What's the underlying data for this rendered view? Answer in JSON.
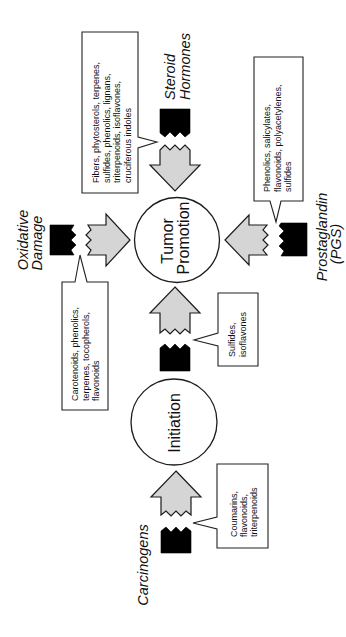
{
  "stages": {
    "tumor_promotion": [
      "Tumor",
      "Promotion"
    ],
    "initiation": "Initiation"
  },
  "factors": {
    "steroid_hormones": [
      "Steroid",
      "Hormones"
    ],
    "oxidative_damage": [
      "Oxidative",
      "Damage"
    ],
    "prostaglandin": [
      "Prostaglandin",
      "(PGS)"
    ],
    "carcinogens": "Carcinogens"
  },
  "inhibitors": {
    "steroid_hormones": [
      "Fibers, phytosterols, terpenes,",
      "sulfides, phenolics, lignans,",
      "triterpenoids, isoflavones,",
      "cruciferous indoles"
    ],
    "prostaglandin": [
      "Phenolics, salicylates,",
      "flavonoids, polyacetylenes,",
      "sulfides"
    ],
    "oxidative_damage": [
      "Carotenoids, phenolics,",
      "terpenes, tocopherols,",
      "flavonoids"
    ],
    "initiation_to_promotion": [
      "Sulfides,",
      "isoflavones"
    ],
    "carcinogens": [
      "Coumarins,",
      "flavonoids,",
      "triterpenoids"
    ]
  },
  "colors": {
    "background": "#ffffff",
    "arrow_fill": "#d5d5d5",
    "block_fill": "#000000",
    "outline": "#1c1c1c"
  }
}
